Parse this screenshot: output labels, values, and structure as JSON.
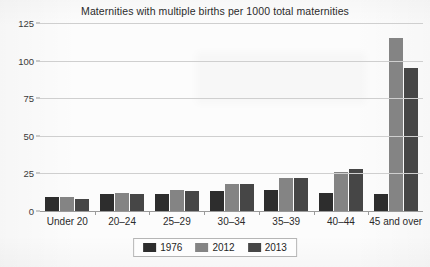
{
  "chart_data": {
    "type": "bar",
    "title": "Maternities with multiple births per 1000 total maternities",
    "xlabel": "",
    "ylabel": "",
    "ylim": [
      0,
      125
    ],
    "yticks": [
      0,
      25,
      50,
      75,
      100,
      125
    ],
    "grid": true,
    "legend_position": "bottom",
    "categories": [
      "Under 20",
      "20–24",
      "25–29",
      "30–34",
      "35–39",
      "40–44",
      "45 and over"
    ],
    "series": [
      {
        "name": "1976",
        "color": "#2d2d2d",
        "values": [
          9,
          11,
          11,
          13,
          14,
          12,
          11
        ]
      },
      {
        "name": "2012",
        "color": "#848484",
        "values": [
          9,
          12,
          14,
          18,
          22,
          26,
          115
        ]
      },
      {
        "name": "2013",
        "color": "#464646",
        "values": [
          8,
          11,
          13,
          18,
          22,
          28,
          95
        ]
      }
    ]
  },
  "axis": {
    "ytick_labels": [
      "125",
      "100",
      "75",
      "50",
      "25",
      "0"
    ]
  },
  "legend": {
    "items": [
      {
        "label": "1976",
        "color": "#2d2d2d"
      },
      {
        "label": "2012",
        "color": "#848484"
      },
      {
        "label": "2013",
        "color": "#464646"
      }
    ]
  }
}
